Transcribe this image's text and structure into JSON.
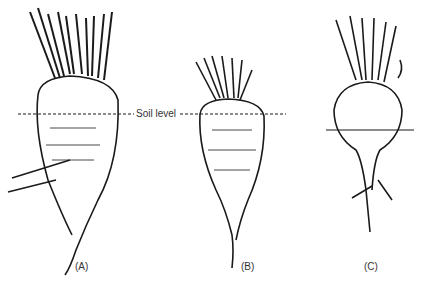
{
  "diagram": {
    "soil_label": "Soil level",
    "panels": [
      {
        "id": "A",
        "label": "(A)"
      },
      {
        "id": "B",
        "label": "(B)"
      },
      {
        "id": "C",
        "label": "(C)"
      }
    ],
    "colors": {
      "ink": "#1a1a1a",
      "paper": "#ffffff"
    }
  }
}
